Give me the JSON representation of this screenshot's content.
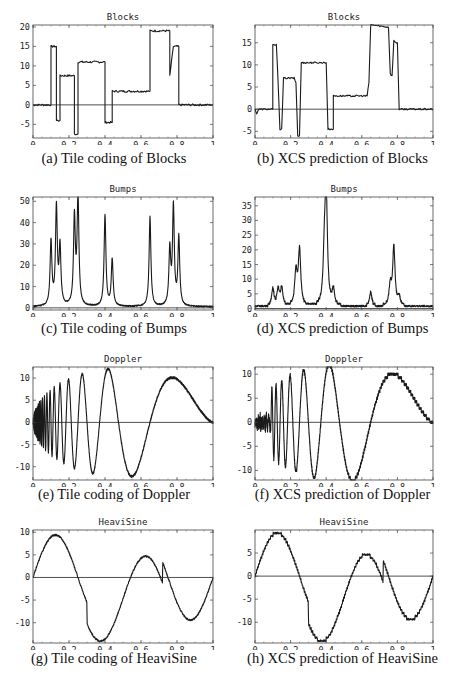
{
  "figure": {
    "panels": [
      {
        "id": "a",
        "title": "Blocks",
        "caption": "(a) Tile coding of Blocks"
      },
      {
        "id": "b",
        "title": "Blocks",
        "caption": "(b) XCS prediction of Blocks"
      },
      {
        "id": "c",
        "title": "Bumps",
        "caption": "(c) Tile coding of Bumps"
      },
      {
        "id": "d",
        "title": "Bumps",
        "caption": "(d) XCS prediction of Bumps"
      },
      {
        "id": "e",
        "title": "Doppler",
        "caption": "(e) Tile coding of Doppler"
      },
      {
        "id": "f",
        "title": "Doppler",
        "caption": "(f) XCS prediction of Doppler"
      },
      {
        "id": "g",
        "title": "HeaviSine",
        "caption": "(g) Tile coding of HeaviSine"
      },
      {
        "id": "h",
        "title": "HeaviSine",
        "caption": "(h) XCS prediction of HeaviSine"
      }
    ]
  },
  "chart_data": [
    {
      "panel": "a",
      "type": "line",
      "title": "Blocks",
      "xlabel": "",
      "ylabel": "",
      "xlim": [
        0,
        1
      ],
      "ylim": [
        -8.5,
        20.5
      ],
      "xticks": [
        "0",
        "0.2",
        "0.4",
        "0.6",
        "0.8",
        "1"
      ],
      "yticks": [
        "-5",
        "0",
        "5",
        "10",
        "15",
        "20"
      ],
      "x": [
        0,
        0.1,
        0.1,
        0.13,
        0.13,
        0.15,
        0.15,
        0.23,
        0.23,
        0.25,
        0.25,
        0.4,
        0.4,
        0.44,
        0.44,
        0.65,
        0.65,
        0.76,
        0.76,
        0.78,
        0.78,
        0.81,
        0.81,
        1
      ],
      "y": [
        0,
        0,
        15,
        15,
        -4,
        -4,
        7.5,
        7.5,
        -7.5,
        -7.5,
        11,
        11,
        -4.5,
        -4.5,
        3.5,
        3.5,
        19,
        19,
        7.5,
        15,
        15,
        15,
        0,
        0
      ]
    },
    {
      "panel": "b",
      "type": "line",
      "title": "Blocks",
      "xlim": [
        0,
        1
      ],
      "ylim": [
        -6.5,
        19
      ],
      "xticks": [
        "0",
        "0.2",
        "0.4",
        "0.6",
        "0.8",
        "1"
      ],
      "yticks": [
        "-5",
        "0",
        "5",
        "10",
        "15"
      ],
      "x": [
        0,
        0.01,
        0.02,
        0.1,
        0.1,
        0.12,
        0.13,
        0.14,
        0.15,
        0.16,
        0.22,
        0.23,
        0.24,
        0.25,
        0.26,
        0.4,
        0.41,
        0.44,
        0.44,
        0.63,
        0.64,
        0.65,
        0.66,
        0.75,
        0.76,
        0.77,
        0.78,
        0.79,
        0.8,
        0.81,
        1
      ],
      "y": [
        0,
        -1,
        0,
        0,
        14.5,
        14.5,
        6,
        -4.5,
        -4.5,
        7,
        7,
        6,
        -6,
        -6,
        10.5,
        10.5,
        -4.5,
        -4.5,
        3,
        3,
        6,
        19,
        19,
        18.5,
        8,
        7.5,
        15.5,
        15,
        15,
        0,
        0
      ]
    },
    {
      "panel": "c",
      "type": "line",
      "title": "Bumps",
      "xlim": [
        0,
        1
      ],
      "ylim": [
        -1,
        52
      ],
      "xticks": [
        "0",
        "0.2",
        "0.4",
        "0.6",
        "0.8",
        "1"
      ],
      "yticks": [
        "0",
        "10",
        "20",
        "30",
        "40",
        "50"
      ],
      "peaks": [
        {
          "x": 0.1,
          "y": 30
        },
        {
          "x": 0.13,
          "y": 46
        },
        {
          "x": 0.15,
          "y": 27
        },
        {
          "x": 0.23,
          "y": 41
        },
        {
          "x": 0.25,
          "y": 51
        },
        {
          "x": 0.4,
          "y": 43
        },
        {
          "x": 0.44,
          "y": 22
        },
        {
          "x": 0.65,
          "y": 42
        },
        {
          "x": 0.76,
          "y": 26
        },
        {
          "x": 0.78,
          "y": 46
        },
        {
          "x": 0.81,
          "y": 32
        }
      ]
    },
    {
      "panel": "d",
      "type": "line",
      "title": "Bumps",
      "xlim": [
        0,
        1
      ],
      "ylim": [
        -0.5,
        38
      ],
      "xticks": [
        "0",
        "0.2",
        "0.4",
        "0.6",
        "0.8",
        "1"
      ],
      "yticks": [
        "0",
        "5",
        "10",
        "15",
        "20",
        "25",
        "30",
        "35"
      ],
      "peaks": [
        {
          "x": 0.1,
          "y": 6
        },
        {
          "x": 0.13,
          "y": 5.5
        },
        {
          "x": 0.15,
          "y": 6
        },
        {
          "x": 0.23,
          "y": 11.5
        },
        {
          "x": 0.25,
          "y": 19
        },
        {
          "x": 0.39,
          "y": 15.5
        },
        {
          "x": 0.4,
          "y": 37
        },
        {
          "x": 0.44,
          "y": 5.5
        },
        {
          "x": 0.65,
          "y": 5
        },
        {
          "x": 0.76,
          "y": 7
        },
        {
          "x": 0.78,
          "y": 20
        },
        {
          "x": 0.81,
          "y": 3
        }
      ]
    },
    {
      "panel": "e",
      "type": "line",
      "title": "Doppler",
      "xlim": [
        0,
        1
      ],
      "ylim": [
        -13,
        12.5
      ],
      "xticks": [
        "0",
        "0.2",
        "0.4",
        "0.6",
        "0.8",
        "1"
      ],
      "yticks": [
        "-10",
        "-5",
        "0",
        "5",
        "10"
      ],
      "function": "Doppler test signal (amplitude ~12), tile-coded approximation",
      "extrema": [
        {
          "x": 0.2,
          "y": 9.5
        },
        {
          "x": 0.27,
          "y": 11
        },
        {
          "x": 0.33,
          "y": -11.5
        },
        {
          "x": 0.42,
          "y": 12
        },
        {
          "x": 0.56,
          "y": -12
        },
        {
          "x": 0.77,
          "y": 10
        },
        {
          "x": 1,
          "y": 0
        }
      ]
    },
    {
      "panel": "f",
      "type": "line",
      "title": "Doppler",
      "xlim": [
        0,
        1
      ],
      "ylim": [
        -12,
        11.5
      ],
      "xticks": [
        "0",
        "0.2",
        "0.4",
        "0.6",
        "0.8",
        "1"
      ],
      "yticks": [
        "-10",
        "-5",
        "0",
        "5",
        "10"
      ],
      "function": "XCS approximation of Doppler; noisy at low x",
      "extrema": [
        {
          "x": 0.2,
          "y": 8.5
        },
        {
          "x": 0.27,
          "y": 10
        },
        {
          "x": 0.33,
          "y": -10.5
        },
        {
          "x": 0.42,
          "y": 11
        },
        {
          "x": 0.56,
          "y": -11.5
        },
        {
          "x": 0.77,
          "y": 9.5
        },
        {
          "x": 1,
          "y": 0
        }
      ]
    },
    {
      "panel": "g",
      "type": "line",
      "title": "HeaviSine",
      "xlim": [
        0,
        1
      ],
      "ylim": [
        -14.5,
        10.5
      ],
      "xticks": [
        "0",
        "0.2",
        "0.4",
        "0.6",
        "0.8",
        "1"
      ],
      "yticks": [
        "-10",
        "-5",
        "0",
        "5",
        "10"
      ],
      "extrema": [
        {
          "x": 0,
          "y": 0
        },
        {
          "x": 0.12,
          "y": 9.5
        },
        {
          "x": 0.3,
          "y": -5.5
        },
        {
          "x": 0.3,
          "y": -10.5
        },
        {
          "x": 0.37,
          "y": -14
        },
        {
          "x": 0.63,
          "y": 4.5
        },
        {
          "x": 0.71,
          "y": -1
        },
        {
          "x": 0.72,
          "y": 3.5
        },
        {
          "x": 0.87,
          "y": -9.5
        },
        {
          "x": 1,
          "y": 0
        }
      ]
    },
    {
      "panel": "h",
      "type": "line",
      "title": "HeaviSine",
      "xlim": [
        0,
        1
      ],
      "ylim": [
        -14.5,
        10
      ],
      "xticks": [
        "0",
        "0.2",
        "0.4",
        "0.6",
        "0.8",
        "1"
      ],
      "yticks": [
        "-10",
        "-5",
        "0",
        "5"
      ],
      "extrema": [
        {
          "x": 0,
          "y": 0
        },
        {
          "x": 0.12,
          "y": 9.5
        },
        {
          "x": 0.3,
          "y": -7
        },
        {
          "x": 0.3,
          "y": -10.5
        },
        {
          "x": 0.37,
          "y": -14
        },
        {
          "x": 0.63,
          "y": 4.5
        },
        {
          "x": 0.71,
          "y": -1
        },
        {
          "x": 0.72,
          "y": 2.5
        },
        {
          "x": 0.87,
          "y": -9.5
        },
        {
          "x": 1,
          "y": -1
        }
      ]
    }
  ]
}
